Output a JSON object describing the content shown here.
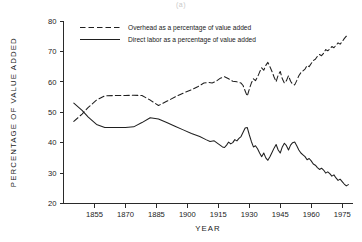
{
  "figure": {
    "caption_fragment": "(a)"
  },
  "chart_data": {
    "type": "line",
    "title": "",
    "xlabel": "YEAR",
    "ylabel": "PERCENTAGE OF VALUE ADDED",
    "xlim": [
      1840,
      1980
    ],
    "ylim": [
      20,
      80
    ],
    "xticks": [
      1855,
      1870,
      1885,
      1900,
      1915,
      1930,
      1945,
      1960,
      1975
    ],
    "yticks": [
      20,
      30,
      40,
      50,
      60,
      70,
      80
    ],
    "grid": false,
    "legend_position": "top-left-inside",
    "series": [
      {
        "name": "Overhead as a percentage of value added",
        "style": "dashed",
        "color": "#1f1f1f",
        "points": [
          [
            1845,
            47.0
          ],
          [
            1849,
            49.4
          ],
          [
            1852,
            51.6
          ],
          [
            1856,
            54.0
          ],
          [
            1860,
            55.4
          ],
          [
            1865,
            55.5
          ],
          [
            1870,
            55.5
          ],
          [
            1874,
            55.6
          ],
          [
            1878,
            55.5
          ],
          [
            1882,
            54.0
          ],
          [
            1886,
            52.2
          ],
          [
            1890,
            53.6
          ],
          [
            1894,
            55.0
          ],
          [
            1898,
            56.3
          ],
          [
            1902,
            57.4
          ],
          [
            1905,
            58.4
          ],
          [
            1908,
            59.6
          ],
          [
            1910,
            59.8
          ],
          [
            1912,
            59.6
          ],
          [
            1914,
            60.2
          ],
          [
            1916,
            61.2
          ],
          [
            1918,
            61.7
          ],
          [
            1920,
            61.0
          ],
          [
            1922,
            60.2
          ],
          [
            1924,
            60.0
          ],
          [
            1926,
            59.6
          ],
          [
            1927,
            58.8
          ],
          [
            1928,
            57.0
          ],
          [
            1929,
            55.3
          ],
          [
            1930,
            57.6
          ],
          [
            1931,
            59.6
          ],
          [
            1932,
            61.0
          ],
          [
            1933,
            60.4
          ],
          [
            1934,
            61.6
          ],
          [
            1935,
            63.2
          ],
          [
            1936,
            64.6
          ],
          [
            1937,
            63.8
          ],
          [
            1938,
            65.4
          ],
          [
            1939,
            66.4
          ],
          [
            1940,
            65.0
          ],
          [
            1941,
            63.4
          ],
          [
            1942,
            61.6
          ],
          [
            1943,
            60.0
          ],
          [
            1944,
            62.2
          ],
          [
            1945,
            63.4
          ],
          [
            1946,
            61.0
          ],
          [
            1947,
            59.6
          ],
          [
            1948,
            60.4
          ],
          [
            1949,
            62.0
          ],
          [
            1950,
            60.2
          ],
          [
            1951,
            59.2
          ],
          [
            1952,
            59.0
          ],
          [
            1953,
            60.4
          ],
          [
            1954,
            62.0
          ],
          [
            1955,
            63.0
          ],
          [
            1956,
            63.6
          ],
          [
            1957,
            64.2
          ],
          [
            1958,
            65.4
          ],
          [
            1959,
            65.0
          ],
          [
            1960,
            66.0
          ],
          [
            1961,
            67.0
          ],
          [
            1962,
            67.4
          ],
          [
            1963,
            68.4
          ],
          [
            1964,
            69.0
          ],
          [
            1965,
            68.6
          ],
          [
            1966,
            69.4
          ],
          [
            1967,
            70.6
          ],
          [
            1968,
            70.2
          ],
          [
            1969,
            70.8
          ],
          [
            1970,
            71.6
          ],
          [
            1971,
            71.2
          ],
          [
            1972,
            72.0
          ],
          [
            1973,
            72.8
          ],
          [
            1974,
            72.4
          ],
          [
            1975,
            73.2
          ],
          [
            1976,
            74.2
          ],
          [
            1977,
            75.0
          ],
          [
            1978,
            75.2
          ]
        ]
      },
      {
        "name": "Direct labor as a percentage of value added",
        "style": "solid",
        "color": "#1f1f1f",
        "points": [
          [
            1845,
            53.0
          ],
          [
            1849,
            50.6
          ],
          [
            1852,
            48.4
          ],
          [
            1856,
            46.0
          ],
          [
            1860,
            45.0
          ],
          [
            1865,
            45.0
          ],
          [
            1870,
            45.0
          ],
          [
            1874,
            45.2
          ],
          [
            1878,
            46.6
          ],
          [
            1882,
            48.2
          ],
          [
            1886,
            47.8
          ],
          [
            1890,
            46.6
          ],
          [
            1894,
            45.4
          ],
          [
            1898,
            44.2
          ],
          [
            1902,
            43.0
          ],
          [
            1906,
            42.0
          ],
          [
            1909,
            41.0
          ],
          [
            1911,
            40.4
          ],
          [
            1913,
            40.6
          ],
          [
            1915,
            39.6
          ],
          [
            1917,
            38.6
          ],
          [
            1918,
            38.4
          ],
          [
            1919,
            39.2
          ],
          [
            1920,
            40.2
          ],
          [
            1921,
            39.6
          ],
          [
            1922,
            40.0
          ],
          [
            1923,
            41.0
          ],
          [
            1924,
            40.6
          ],
          [
            1925,
            41.4
          ],
          [
            1926,
            42.0
          ],
          [
            1927,
            43.4
          ],
          [
            1928,
            44.8
          ],
          [
            1929,
            45.0
          ],
          [
            1930,
            42.6
          ],
          [
            1931,
            40.4
          ],
          [
            1932,
            38.6
          ],
          [
            1933,
            39.0
          ],
          [
            1934,
            38.0
          ],
          [
            1935,
            36.6
          ],
          [
            1936,
            35.4
          ],
          [
            1937,
            36.6
          ],
          [
            1938,
            35.0
          ],
          [
            1939,
            34.2
          ],
          [
            1940,
            35.4
          ],
          [
            1941,
            36.8
          ],
          [
            1942,
            38.2
          ],
          [
            1943,
            39.4
          ],
          [
            1944,
            37.6
          ],
          [
            1945,
            36.6
          ],
          [
            1946,
            38.6
          ],
          [
            1947,
            39.8
          ],
          [
            1948,
            39.0
          ],
          [
            1949,
            37.6
          ],
          [
            1950,
            39.2
          ],
          [
            1951,
            40.0
          ],
          [
            1952,
            40.2
          ],
          [
            1953,
            39.0
          ],
          [
            1954,
            37.6
          ],
          [
            1955,
            36.6
          ],
          [
            1956,
            36.0
          ],
          [
            1957,
            35.4
          ],
          [
            1958,
            34.4
          ],
          [
            1959,
            34.8
          ],
          [
            1960,
            34.0
          ],
          [
            1961,
            33.0
          ],
          [
            1962,
            32.6
          ],
          [
            1963,
            31.8
          ],
          [
            1964,
            31.2
          ],
          [
            1965,
            31.6
          ],
          [
            1966,
            31.0
          ],
          [
            1967,
            30.0
          ],
          [
            1968,
            30.4
          ],
          [
            1969,
            29.8
          ],
          [
            1970,
            29.0
          ],
          [
            1971,
            29.4
          ],
          [
            1972,
            28.4
          ],
          [
            1973,
            27.6
          ],
          [
            1974,
            28.0
          ],
          [
            1975,
            27.2
          ],
          [
            1976,
            26.4
          ],
          [
            1977,
            25.8
          ],
          [
            1978,
            26.2
          ]
        ]
      }
    ]
  }
}
